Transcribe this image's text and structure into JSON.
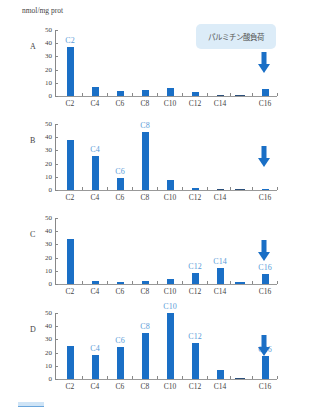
{
  "chart_data": [
    {
      "type": "bar",
      "panel": "A",
      "categories": [
        "C2",
        "C4",
        "C6",
        "C8",
        "C10",
        "C12",
        "C14",
        "",
        "C16"
      ],
      "values": [
        37,
        6.5,
        4,
        4.5,
        6,
        3,
        0.5,
        0.5,
        5
      ],
      "highlighted": [
        "C2"
      ],
      "ylabel": "nmol/mg prot",
      "ylim": [
        0,
        50
      ],
      "yticks": [
        0,
        10,
        20,
        30,
        40,
        50
      ],
      "annotation": "パルミチン酸負荷"
    },
    {
      "type": "bar",
      "panel": "B",
      "categories": [
        "C2",
        "C4",
        "C6",
        "C8",
        "C10",
        "C12",
        "C14",
        "",
        "C16"
      ],
      "values": [
        38,
        26,
        9,
        44,
        7.5,
        1.5,
        0.3,
        0,
        1
      ],
      "highlighted": [
        "C4",
        "C6",
        "C8"
      ],
      "ylim": [
        0,
        50
      ],
      "yticks": [
        0,
        10,
        20,
        30,
        40,
        50
      ]
    },
    {
      "type": "bar",
      "panel": "C",
      "categories": [
        "C2",
        "C4",
        "C6",
        "C8",
        "C10",
        "C12",
        "C14",
        "",
        "C16"
      ],
      "values": [
        34,
        2,
        1.5,
        2.5,
        4,
        8,
        12.5,
        1.5,
        7.5
      ],
      "highlighted": [
        "C12",
        "C14",
        "C16"
      ],
      "ylim": [
        0,
        50
      ],
      "yticks": [
        0,
        10,
        20,
        30,
        40,
        50
      ]
    },
    {
      "type": "bar",
      "panel": "D",
      "categories": [
        "C2",
        "C4",
        "C6",
        "C8",
        "C10",
        "C12",
        "C14",
        "",
        "C16"
      ],
      "values": [
        25,
        18,
        24.5,
        35,
        50,
        27.5,
        6.5,
        0.8,
        17.5
      ],
      "highlighted": [
        "C4",
        "C6",
        "C8",
        "C10",
        "C12",
        "C16"
      ],
      "ylim": [
        0,
        50
      ],
      "yticks": [
        0,
        10,
        20,
        30,
        40,
        50
      ]
    }
  ],
  "unit_label": "nmol/mg prot",
  "annotation": "パルミチン酸負荷",
  "panels": [
    {
      "label": "A",
      "top": 30,
      "yticks": [
        "50",
        "40",
        "30",
        "20",
        "10",
        "0"
      ],
      "cats": [
        "C2",
        "C4",
        "C6",
        "C8",
        "C10",
        "C12",
        "C14",
        "C16"
      ],
      "bar_labels": [
        {
          "text": "C2",
          "idx": 0
        }
      ],
      "values": [
        37,
        6.5,
        4,
        4.5,
        6,
        3,
        0.5,
        0.5,
        5
      ],
      "arrow": true
    },
    {
      "label": "B",
      "top": 124,
      "yticks": [
        "50",
        "40",
        "30",
        "20",
        "10",
        "0"
      ],
      "cats": [
        "C2",
        "C4",
        "C6",
        "C8",
        "C10",
        "C12",
        "C14",
        "C16"
      ],
      "bar_labels": [
        {
          "text": "C4",
          "idx": 1
        },
        {
          "text": "C6",
          "idx": 2
        },
        {
          "text": "C8",
          "idx": 3
        }
      ],
      "values": [
        38,
        26,
        9,
        44,
        7.5,
        1.5,
        0.3,
        0,
        1
      ],
      "arrow": true
    },
    {
      "label": "C",
      "top": 218,
      "yticks": [
        "50",
        "40",
        "30",
        "20",
        "10",
        "0"
      ],
      "cats": [
        "C2",
        "C4",
        "C6",
        "C8",
        "C10",
        "C12",
        "C14",
        "C16"
      ],
      "bar_labels": [
        {
          "text": "C12",
          "idx": 5
        },
        {
          "text": "C14",
          "idx": 6
        },
        {
          "text": "C16",
          "idx": 8
        }
      ],
      "values": [
        34,
        2,
        1.5,
        2.5,
        4,
        8,
        12.5,
        1.5,
        7.5
      ],
      "arrow": true
    },
    {
      "label": "D",
      "top": 313,
      "yticks": [
        "50",
        "40",
        "30",
        "20",
        "10",
        "0"
      ],
      "cats": [
        "C2",
        "C4",
        "C6",
        "C8",
        "C10",
        "C12",
        "C14",
        "C16"
      ],
      "bar_labels": [
        {
          "text": "C4",
          "idx": 1
        },
        {
          "text": "C6",
          "idx": 2
        },
        {
          "text": "C8",
          "idx": 3
        },
        {
          "text": "C10",
          "idx": 4
        },
        {
          "text": "C12",
          "idx": 5
        },
        {
          "text": "C16",
          "idx": 8
        }
      ],
      "values": [
        25,
        18,
        24.5,
        35,
        50,
        27.5,
        6.5,
        0.8,
        17.5
      ],
      "arrow": true
    }
  ],
  "colors": {
    "bar": "#1a6fc6",
    "bar_label": "#5a9bd8",
    "callout_bg": "#dcecf8",
    "arrow": "#1a6fc6"
  }
}
